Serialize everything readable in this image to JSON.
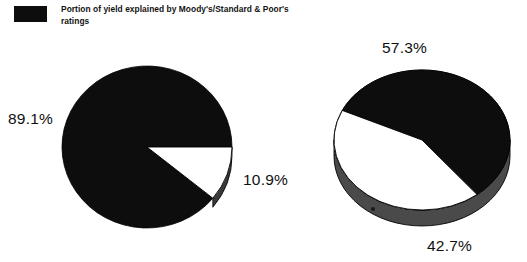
{
  "legend": {
    "swatch_color": "#0d0d0d",
    "text": "Portion of yield explained by Moody's/Standard & Poor's ratings"
  },
  "colors": {
    "explained": "#0d0d0d",
    "unexplained": "#ffffff",
    "outline": "#000000",
    "edge_shadow": "#3a3a3a",
    "text": "#101010"
  },
  "chart_data": [
    {
      "type": "pie",
      "title": "",
      "chart_id": "left-pie",
      "labels": [
        "Portion of yield explained by Moody's/Standard & Poor's ratings",
        "Remainder"
      ],
      "values": [
        89.1,
        10.9
      ],
      "display_labels": [
        "89.1%",
        "10.9%"
      ],
      "colors": [
        "#0d0d0d",
        "#ffffff"
      ],
      "legend_position": "top-left",
      "three_d": true,
      "geometry": {
        "center_x": 147,
        "center_y": 147,
        "rx": 85,
        "ry": 81,
        "depth": 9,
        "start_angle_deg": 0,
        "direction": "clockwise"
      }
    },
    {
      "type": "pie",
      "title": "",
      "chart_id": "right-pie",
      "labels": [
        "Portion of yield explained by Moody's/Standard & Poor's ratings",
        "Remainder"
      ],
      "values": [
        57.3,
        42.7
      ],
      "display_labels": [
        "57.3%",
        "42.7%"
      ],
      "colors": [
        "#0d0d0d",
        "#ffffff"
      ],
      "legend_position": "top-left",
      "three_d": true,
      "geometry": {
        "center_x": 422,
        "center_y": 140,
        "rx": 88,
        "ry": 70,
        "depth": 16,
        "start_angle_deg": 205,
        "direction": "clockwise"
      }
    }
  ],
  "labels": {
    "left_major": "89.1%",
    "left_minor": "10.9%",
    "right_major": "57.3%",
    "right_minor": "42.7%"
  }
}
